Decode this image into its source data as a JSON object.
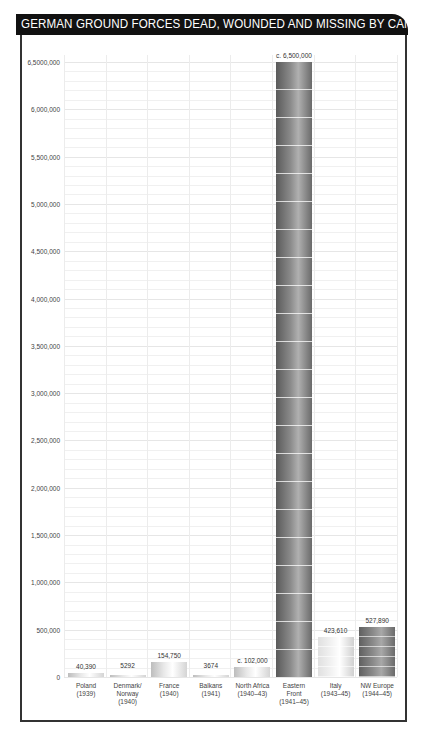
{
  "title": "GERMAN GROUND FORCES DEAD, WOUNDED AND MISSING BY CAMPAIGN",
  "y_axis": {
    "ticks": [
      {
        "label": "6,5000,000",
        "value": 6500000
      },
      {
        "label": "6,000,000",
        "value": 6000000
      },
      {
        "label": "5,500,000",
        "value": 5500000
      },
      {
        "label": "5,000,000",
        "value": 5000000
      },
      {
        "label": "4,500,000",
        "value": 4500000
      },
      {
        "label": "4,000,000",
        "value": 4000000
      },
      {
        "label": "3,500,000",
        "value": 3500000
      },
      {
        "label": "3,000,000",
        "value": 3000000
      },
      {
        "label": "2,500,000",
        "value": 2500000
      },
      {
        "label": "2,000,000",
        "value": 2000000
      },
      {
        "label": "1,500,000",
        "value": 1500000
      },
      {
        "label": "1,000,000",
        "value": 1000000
      },
      {
        "label": "500,000",
        "value": 500000
      },
      {
        "label": "0",
        "value": 0
      }
    ]
  },
  "bars": [
    {
      "category": "Poland\n(1939)",
      "value_label": "40,390",
      "style": "light"
    },
    {
      "category": "Denmark/\nNorway\n(1940)",
      "value_label": "5292",
      "style": "light"
    },
    {
      "category": "France\n(1940)",
      "value_label": "154,750",
      "style": "light"
    },
    {
      "category": "Balkans\n(1941)",
      "value_label": "3674",
      "style": "light"
    },
    {
      "category": "North Africa\n(1940–43)",
      "value_label": "c. 102,000",
      "style": "light"
    },
    {
      "category": "Eastern\nFront\n(1941–45)",
      "value_label": "c. 6,500,000",
      "style": "dark"
    },
    {
      "category": "Italy\n(1943–45)",
      "value_label": "423,610",
      "style": "mid"
    },
    {
      "category": "NW Europe\n(1944–45)",
      "value_label": "527,890",
      "style": "nw"
    }
  ],
  "colors": {
    "header_bg": "#111111",
    "header_text": "#ffffff",
    "bar_dark": "#7a7a7a",
    "bar_light": "#e0e0e0"
  },
  "chart_data": {
    "type": "bar",
    "title": "GERMAN GROUND FORCES DEAD, WOUNDED AND MISSING BY CAMPAIGN",
    "categories": [
      "Poland (1939)",
      "Denmark/Norway (1940)",
      "France (1940)",
      "Balkans (1941)",
      "North Africa (1940–43)",
      "Eastern Front (1941–45)",
      "Italy (1943–45)",
      "NW Europe (1944–45)"
    ],
    "values": [
      40390,
      5292,
      154750,
      3674,
      102000,
      6500000,
      423610,
      527890
    ],
    "value_labels": [
      "40,390",
      "5292",
      "154,750",
      "3674",
      "c. 102,000",
      "c. 6,500,000",
      "423,610",
      "527,890"
    ],
    "xlabel": "",
    "ylabel": "",
    "ylim": [
      0,
      6500000
    ],
    "yticks": [
      0,
      500000,
      1000000,
      1500000,
      2000000,
      2500000,
      3000000,
      3500000,
      4000000,
      4500000,
      5000000,
      5500000,
      6000000,
      6500000
    ],
    "ytick_labels": [
      "0",
      "500,000",
      "1,000,000",
      "1,500,000",
      "2,000,000",
      "2,500,000",
      "3,000,000",
      "3,500,000",
      "4,000,000",
      "4,500,000",
      "5,000,000",
      "5,500,000",
      "6,000,000",
      "6,5000,000"
    ],
    "grid": true,
    "legend": null
  }
}
